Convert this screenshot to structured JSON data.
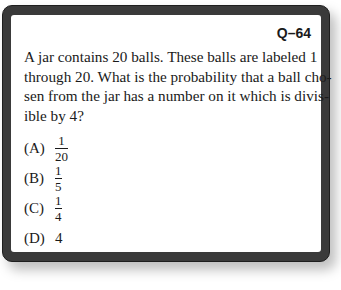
{
  "card": {
    "question_number": "Q–64",
    "question_lines": [
      "A jar contains 20 balls. These balls are labeled 1",
      "through 20. What is the probability that a ball cho-",
      "sen from the jar has a number on it which is divis-",
      "ible by 4?"
    ],
    "options": [
      {
        "label": "(A)",
        "numerator": "1",
        "denominator": "20"
      },
      {
        "label": "(B)",
        "numerator": "1",
        "denominator": "5"
      },
      {
        "label": "(C)",
        "numerator": "1",
        "denominator": "4"
      },
      {
        "label": "(D)",
        "value": "4"
      }
    ]
  }
}
